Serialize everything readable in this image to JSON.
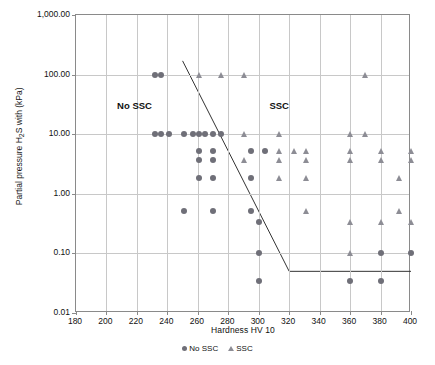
{
  "chart_data": {
    "type": "scatter",
    "title": "",
    "xlabel": "Hardness HV 10",
    "ylabel": "Partial pressure H₂S with (kPa)",
    "xlim": [
      180,
      400
    ],
    "ylim": [
      0.01,
      1000
    ],
    "yscale": "log",
    "xticks": [
      180,
      200,
      220,
      240,
      260,
      280,
      300,
      320,
      340,
      360,
      380,
      400
    ],
    "xticklabels": [
      "180",
      "200",
      "220",
      "240",
      "260",
      "280",
      "300",
      "320",
      "340",
      "360",
      "380",
      "400"
    ],
    "yticks": [
      0.01,
      0.1,
      1,
      10,
      100,
      1000
    ],
    "yticklabels": [
      "0.01",
      "0.10",
      "1.00",
      "10.00",
      "100.00",
      "1,000.00"
    ],
    "grid": true,
    "legend_position": "bottom",
    "annotations": [
      {
        "text": "No SSC",
        "x": 207,
        "y": 30
      },
      {
        "text": "SSC",
        "x": 307,
        "y": 30
      }
    ],
    "boundary_lines": [
      {
        "name": "sloped-threshold",
        "points": [
          [
            250,
            170
          ],
          [
            320,
            0.05
          ]
        ]
      },
      {
        "name": "horizontal-threshold",
        "points": [
          [
            320,
            0.05
          ],
          [
            400,
            0.05
          ]
        ]
      }
    ],
    "series": [
      {
        "name": "No SSC",
        "marker": "circle",
        "color": "#6f6f78",
        "points": [
          [
            232,
            100
          ],
          [
            236,
            100
          ],
          [
            232,
            10
          ],
          [
            236,
            10
          ],
          [
            241,
            10
          ],
          [
            251,
            10
          ],
          [
            257,
            10
          ],
          [
            261,
            10
          ],
          [
            265,
            10
          ],
          [
            270,
            10
          ],
          [
            275,
            10
          ],
          [
            261,
            5.2
          ],
          [
            270,
            5.2
          ],
          [
            295,
            5.2
          ],
          [
            304,
            5.2
          ],
          [
            261,
            3.7
          ],
          [
            270,
            3.7
          ],
          [
            261,
            1.85
          ],
          [
            270,
            1.85
          ],
          [
            295,
            1.85
          ],
          [
            251,
            0.52
          ],
          [
            270,
            0.52
          ],
          [
            295,
            0.52
          ],
          [
            300,
            0.34
          ],
          [
            300,
            0.1
          ],
          [
            380,
            0.1
          ],
          [
            400,
            0.1
          ],
          [
            300,
            0.035
          ],
          [
            360,
            0.035
          ],
          [
            380,
            0.035
          ]
        ]
      },
      {
        "name": "SSC",
        "marker": "triangle",
        "color": "#8d8d95",
        "points": [
          [
            261,
            100
          ],
          [
            275,
            100
          ],
          [
            290,
            100
          ],
          [
            370,
            100
          ],
          [
            290,
            10
          ],
          [
            313,
            10
          ],
          [
            360,
            10
          ],
          [
            370,
            10
          ],
          [
            290,
            3.7
          ],
          [
            313,
            5.2
          ],
          [
            313,
            3.7
          ],
          [
            323,
            5.2
          ],
          [
            331,
            5.2
          ],
          [
            331,
            3.7
          ],
          [
            360,
            5.2
          ],
          [
            360,
            3.7
          ],
          [
            380,
            5.2
          ],
          [
            380,
            3.7
          ],
          [
            400,
            5.2
          ],
          [
            400,
            3.7
          ],
          [
            313,
            1.85
          ],
          [
            331,
            1.85
          ],
          [
            392,
            1.85
          ],
          [
            331,
            0.52
          ],
          [
            392,
            0.52
          ],
          [
            360,
            0.33
          ],
          [
            380,
            0.33
          ],
          [
            400,
            0.33
          ],
          [
            360,
            0.1
          ]
        ]
      }
    ]
  },
  "legend": {
    "items": [
      {
        "label": "No SSC",
        "marker": "circle-marker"
      },
      {
        "label": "SSC",
        "marker": "triangle-marker"
      }
    ]
  }
}
